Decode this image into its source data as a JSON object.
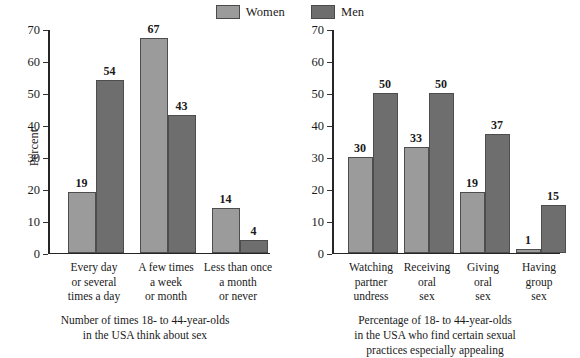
{
  "legend": {
    "entries": [
      {
        "label": "Women",
        "color": "#9b9b9b",
        "icon": "legend-swatch-women"
      },
      {
        "label": "Men",
        "color": "#6e6e6e",
        "icon": "legend-swatch-men"
      }
    ]
  },
  "axis": {
    "ticks": [
      "0",
      "10",
      "20",
      "30",
      "40",
      "50",
      "60",
      "70"
    ],
    "ylabel": "Percent"
  },
  "left": {
    "ylabel": "Percent",
    "categories": [
      "Every day\nor several\ntimes a day",
      "A few times\na week\nor month",
      "Less than once\na month\nor never"
    ],
    "cat_lines": [
      [
        "Every day",
        "or several",
        "times a day"
      ],
      [
        "A few times",
        "a week",
        "or month"
      ],
      [
        "Less than once",
        "a month",
        "or never"
      ]
    ],
    "women": [
      19,
      67,
      14
    ],
    "men": [
      54,
      43,
      4
    ],
    "caption_lines": [
      "Number of times 18- to 44-year-olds",
      "in the USA think about sex"
    ]
  },
  "right": {
    "categories": [
      "Watching\npartner\nundress",
      "Receiving\noral\nsex",
      "Giving\noral\nsex",
      "Having\ngroup\nsex"
    ],
    "cat_lines": [
      [
        "Watching",
        "partner",
        "undress"
      ],
      [
        "Receiving",
        "oral",
        "sex"
      ],
      [
        "Giving",
        "oral",
        "sex"
      ],
      [
        "Having",
        "group",
        "sex"
      ]
    ],
    "women": [
      30,
      33,
      19,
      1
    ],
    "men": [
      50,
      50,
      37,
      15
    ],
    "caption_lines": [
      "Percentage of 18- to 44-year-olds",
      "in the USA who find certain sexual",
      "practices especially appealing"
    ]
  },
  "chart_data": [
    {
      "type": "bar",
      "title": "Number of times 18- to 44-year-olds in the USA think about sex",
      "xlabel": "",
      "ylabel": "Percent",
      "ylim": [
        0,
        70
      ],
      "yticks": [
        0,
        10,
        20,
        30,
        40,
        50,
        60,
        70
      ],
      "grid": false,
      "legend_position": "top-center",
      "categories": [
        "Every day or several times a day",
        "A few times a week or month",
        "Less than once a month or never"
      ],
      "series": [
        {
          "name": "Women",
          "color": "#9b9b9b",
          "values": [
            19,
            67,
            14
          ]
        },
        {
          "name": "Men",
          "color": "#6e6e6e",
          "values": [
            54,
            43,
            4
          ]
        }
      ]
    },
    {
      "type": "bar",
      "title": "Percentage of 18- to 44-year-olds in the USA who find certain sexual practices especially appealing",
      "xlabel": "",
      "ylabel": "Percent",
      "ylim": [
        0,
        70
      ],
      "yticks": [
        0,
        10,
        20,
        30,
        40,
        50,
        60,
        70
      ],
      "grid": false,
      "legend_position": "top-center",
      "categories": [
        "Watching partner undress",
        "Receiving oral sex",
        "Giving oral sex",
        "Having group sex"
      ],
      "series": [
        {
          "name": "Women",
          "color": "#9b9b9b",
          "values": [
            30,
            33,
            19,
            1
          ]
        },
        {
          "name": "Men",
          "color": "#6e6e6e",
          "values": [
            50,
            50,
            37,
            15
          ]
        }
      ]
    }
  ]
}
